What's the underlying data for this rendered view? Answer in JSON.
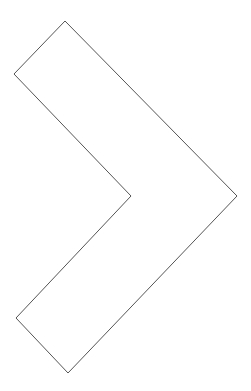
{
  "shape": {
    "name": "chevron-right",
    "stroke": "#555555",
    "fill": "#ffffff",
    "stroke_width": 1,
    "points": "65,21 14,74 131,196 16,318 68,373 237,196"
  }
}
